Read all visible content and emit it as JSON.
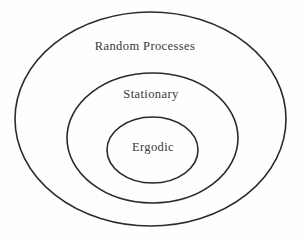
{
  "diagram": {
    "type": "nested-sets",
    "title": "",
    "sets": {
      "outer": {
        "label": "Random Processes",
        "rank": 1
      },
      "middle": {
        "label": "Stationary",
        "rank": 2
      },
      "inner": {
        "label": "Ergodic",
        "rank": 3
      }
    },
    "relationship": "inner subset of middle subset of outer",
    "colors": {
      "stroke": "#2b2b2b",
      "text": "#383838",
      "background": "#fefefe"
    }
  }
}
